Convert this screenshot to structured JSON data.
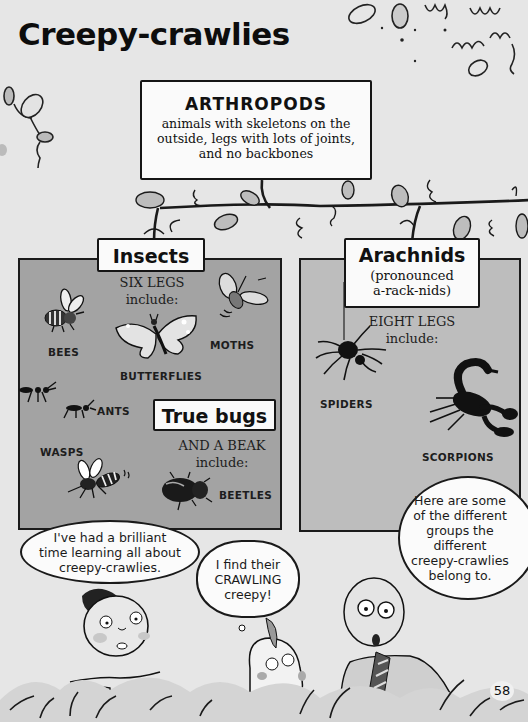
{
  "page": {
    "title": "Creepy-crawlies",
    "page_number": "58"
  },
  "tree": {
    "root": {
      "title": "ARTHROPODS",
      "description_lines": [
        "animals with skeletons on the",
        "outside, legs with lots of joints,",
        "and no backbones"
      ]
    },
    "groups": [
      {
        "name": "Insects",
        "caption_lines": [
          "SIX LEGS",
          "include:"
        ],
        "members": [
          "BEES",
          "BUTTERFLIES",
          "MOTHS",
          "ANTS",
          "WASPS"
        ],
        "subgroup": {
          "name": "True bugs",
          "caption_lines": [
            "AND A BEAK",
            "include:"
          ],
          "members": [
            "BEETLES"
          ]
        }
      },
      {
        "name": "Arachnids",
        "pronunciation_lines": [
          "(pronounced",
          "a-rack-nids)"
        ],
        "caption_lines": [
          "EIGHT LEGS",
          "include:"
        ],
        "members": [
          "SPIDERS",
          "SCORPIONS"
        ]
      }
    ]
  },
  "characters": {
    "boy": {
      "speech_lines": [
        "I've had a brilliant",
        "time learning all about",
        "creepy-crawlies."
      ]
    },
    "dog": {
      "thought_lines": [
        "I find their",
        "CRAWLING",
        "creepy!"
      ]
    },
    "professor": {
      "speech_lines": [
        "Here are some",
        "of the different",
        "groups the",
        "different",
        "creepy-crawlies",
        "belong to."
      ]
    }
  },
  "colors": {
    "page_bg": "#e6e6e6",
    "insects_panel": "#a3a3a3",
    "arachnids_panel": "#bdbdbd",
    "box_bg": "#fafafa",
    "ink": "#151515"
  }
}
